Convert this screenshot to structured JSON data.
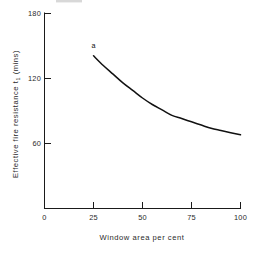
{
  "chart_data": {
    "type": "line",
    "title": "",
    "subtitle": "",
    "xlabel": "Window area per cent",
    "ylabel": "Effective fire resistance t₁ (mins)",
    "ylabel_main": "Effective fire resistance t",
    "ylabel_sub": "1",
    "ylabel_tail": " (mins)",
    "grid": false,
    "legend": false,
    "legend_position": "none",
    "xlim": [
      0,
      100
    ],
    "ylim": [
      0,
      180
    ],
    "xticks": [
      0,
      25,
      50,
      75,
      100
    ],
    "xtick_labels": [
      "0",
      "25",
      "50",
      "75",
      "100"
    ],
    "yticks": [
      60,
      120,
      180
    ],
    "ytick_labels": [
      "60",
      "120",
      "180"
    ],
    "series": [
      {
        "name": "a",
        "annotation": "a",
        "x": [
          25,
          30,
          35,
          40,
          45,
          50,
          55,
          60,
          65,
          70,
          75,
          80,
          85,
          90,
          95,
          100
        ],
        "values": [
          141,
          132,
          124,
          116,
          109,
          102,
          96,
          91,
          86,
          83,
          80,
          77,
          74,
          72,
          70,
          68
        ]
      }
    ],
    "annotations": [
      {
        "text": "a",
        "x": 25,
        "y": 148
      }
    ]
  },
  "colors": {
    "axis": "#1a1a1a",
    "curve": "#111111",
    "text": "#2a2a2a",
    "background": "#ffffff"
  }
}
